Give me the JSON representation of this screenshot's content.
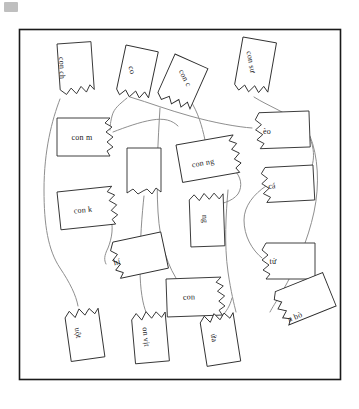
{
  "page": {
    "background_color": "#ffffff",
    "frame_color": "#1a1a1a",
    "card_stroke_color": "#2a2a2a",
    "connector_color": "#8c8c8c",
    "text_color": "#18181a"
  },
  "frame": {
    "x": 19,
    "y": 29,
    "width": 322,
    "height": 351
  },
  "cards": [
    {
      "id": "card-con-ch",
      "label": "con ch",
      "x": 57,
      "y": 44,
      "rotation": 88,
      "shape": "torn-bottom"
    },
    {
      "id": "card-co",
      "label": "co",
      "x": 126,
      "y": 45,
      "rotation": 76,
      "shape": "torn-bottom"
    },
    {
      "id": "card-con-c",
      "label": "con c",
      "x": 181,
      "y": 62,
      "rotation": 63,
      "shape": "torn-bottom"
    },
    {
      "id": "card-con-su",
      "label": "con sư",
      "x": 248,
      "y": 46,
      "rotation": 80,
      "shape": "torn-bottom"
    },
    {
      "id": "card-con-m",
      "label": "con m",
      "x": 90,
      "y": 130,
      "rotation": 0,
      "shape": "torn-right"
    },
    {
      "id": "card-eo",
      "label": "èo",
      "x": 271,
      "y": 124,
      "rotation": 0,
      "shape": "torn-left"
    },
    {
      "id": "card-con-ng",
      "label": "con ng",
      "x": 208,
      "y": 158,
      "rotation": -10,
      "shape": "torn-right"
    },
    {
      "id": "card-ca",
      "label": "cá",
      "x": 276,
      "y": 181,
      "rotation": 0,
      "shape": "torn-left"
    },
    {
      "id": "card-con-k",
      "label": "con k",
      "x": 89,
      "y": 205,
      "rotation": -6,
      "shape": "torn-right"
    },
    {
      "id": "card-blank",
      "label": "",
      "x": 143,
      "y": 170,
      "rotation": 0,
      "shape": "torn-bottom"
    },
    {
      "id": "card-nu",
      "label": "ng",
      "x": 204,
      "y": 218,
      "rotation": 88,
      "shape": "torn-top"
    },
    {
      "id": "card-hi",
      "label": "hí",
      "x": 123,
      "y": 260,
      "rotation": -10,
      "shape": "torn-left"
    },
    {
      "id": "card-tu",
      "label": "tử",
      "x": 277,
      "y": 257,
      "rotation": 0,
      "shape": "torn-left"
    },
    {
      "id": "card-con",
      "label": "con",
      "x": 195,
      "y": 292,
      "rotation": 0,
      "shape": "torn-right"
    },
    {
      "id": "card-uot",
      "label": "uột",
      "x": 80,
      "y": 325,
      "rotation": 82,
      "shape": "torn-top"
    },
    {
      "id": "card-on-vit",
      "label": "on vịt",
      "x": 147,
      "y": 327,
      "rotation": 84,
      "shape": "torn-top"
    },
    {
      "id": "card-ua",
      "label": "ứa",
      "x": 215,
      "y": 330,
      "rotation": 80,
      "shape": "torn-top"
    },
    {
      "id": "card-n-bo",
      "label": "n bò",
      "x": 292,
      "y": 312,
      "rotation": -22,
      "shape": "torn-left"
    }
  ],
  "connectors": [
    {
      "id": "link-con-ch-to-uot",
      "from": "card-con-ch",
      "to": "card-uot"
    },
    {
      "id": "link-co-to-eo",
      "from": "card-co",
      "to": "card-eo"
    },
    {
      "id": "link-co-to-con-m",
      "from": "card-co",
      "to": "card-con-m"
    },
    {
      "id": "link-con-c-to-con-ng",
      "from": "card-con-c",
      "to": "card-con-ng"
    },
    {
      "id": "link-con-su-to-ca",
      "from": "card-con-su",
      "to": "card-ca"
    },
    {
      "id": "link-con-k-to-hi",
      "from": "card-con-k",
      "to": "card-hi"
    },
    {
      "id": "link-blank-to-on-vit",
      "from": "card-blank",
      "to": "card-on-vit"
    },
    {
      "id": "link-con-ng-to-nu",
      "from": "card-con-ng",
      "to": "card-nu"
    },
    {
      "id": "link-ca-to-tu",
      "from": "card-ca",
      "to": "card-tu"
    },
    {
      "id": "link-con-to-ua",
      "from": "card-con",
      "to": "card-ua"
    },
    {
      "id": "link-eo-to-n-bo",
      "from": "card-eo",
      "to": "card-n-bo"
    }
  ]
}
